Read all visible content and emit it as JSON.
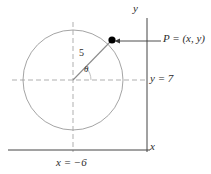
{
  "figure": {
    "type": "geometry-diagram",
    "background_color": "#ffffff",
    "axes": {
      "x_axis_label": "x",
      "y_axis_label": "y",
      "axis_color": "#444444"
    },
    "circle": {
      "center_x": 73,
      "center_y": 80,
      "radius_px": 50,
      "stroke_color": "#9a9a9a"
    },
    "point": {
      "label": "P = (x, y)",
      "marker": "filled-dot",
      "marker_color": "#000000",
      "x_px": 112,
      "y_px": 40
    },
    "radius_segment": {
      "label": "5",
      "value": 5,
      "stroke_color": "#8c8c8c"
    },
    "angle": {
      "label": "θ",
      "vertex": "circle-center"
    },
    "guide_lines": {
      "horizontal_label": "y = 7",
      "horizontal_value": 7,
      "vertical_label": "x = −6",
      "vertical_value": -6,
      "dash_color": "#a6a6a6"
    },
    "annotation_arrow": {
      "direction": "left",
      "points_to": "point-p",
      "stroke_color": "#3a3a3a"
    }
  }
}
